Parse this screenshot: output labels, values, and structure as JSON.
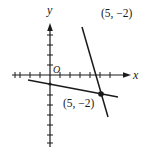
{
  "figure": {
    "axes": {
      "x_label": "x",
      "y_label": "y",
      "origin_label": "O",
      "tick_spacing_units": 1,
      "x_ticks_negative": 4,
      "x_ticks_positive": 6,
      "y_ticks_positive": 5,
      "y_ticks_negative": 7
    },
    "labels": {
      "top_right_point": "(5, −2)",
      "intersection_point": "(5, −2)"
    },
    "lines": [
      {
        "name": "steep-line",
        "description": "steep line with negative slope through (5, -2)"
      },
      {
        "name": "shallow-line",
        "description": "shallow line with negative slope through (5, -2)"
      }
    ],
    "points": [
      {
        "name": "intersection",
        "x": 5,
        "y": -2
      },
      {
        "name": "y-intercept-dot",
        "x": 0,
        "y": -1
      }
    ],
    "colors": {
      "ink": "#1a1a1a",
      "background": "#ffffff"
    }
  }
}
